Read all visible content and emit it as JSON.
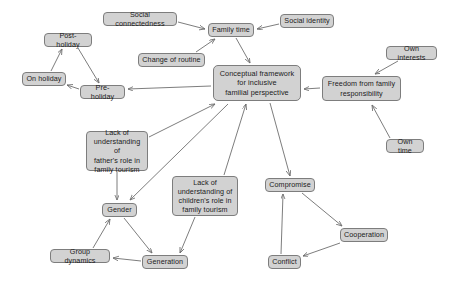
{
  "diagram": {
    "type": "concept-map",
    "canvas": {
      "width": 460,
      "height": 288
    },
    "style": {
      "node_fill": "#d2d2d2",
      "node_border": "#7d7d7d",
      "node_text": "#1b1b1b",
      "arrow_color": "#6e6e6e",
      "background": "#ffffff"
    },
    "nodes": [
      {
        "id": "social_connectedness",
        "label": "Social connectedness",
        "x": 103,
        "y": 12,
        "w": 74,
        "h": 14
      },
      {
        "id": "family_time",
        "label": "Family time",
        "x": 208,
        "y": 23,
        "w": 46,
        "h": 14
      },
      {
        "id": "social_identity",
        "label": "Social identity",
        "x": 280,
        "y": 14,
        "w": 54,
        "h": 14
      },
      {
        "id": "post_holiday",
        "label": "Post-holiday",
        "x": 44,
        "y": 33,
        "w": 48,
        "h": 14
      },
      {
        "id": "own_interests",
        "label": "Own interests",
        "x": 386,
        "y": 46,
        "w": 51,
        "h": 14
      },
      {
        "id": "change_of_routine",
        "label": "Change of routine",
        "x": 138,
        "y": 53,
        "w": 67,
        "h": 14
      },
      {
        "id": "on_holiday",
        "label": "On holiday",
        "x": 22,
        "y": 72,
        "w": 44,
        "h": 14
      },
      {
        "id": "conceptual_framework",
        "label": "Conceptual framework\nfor inclusive\nfamilial perspective",
        "x": 213,
        "y": 65,
        "w": 88,
        "h": 36
      },
      {
        "id": "freedom_family_resp",
        "label": "Freedom from family\nresponsibility",
        "x": 322,
        "y": 76,
        "w": 79,
        "h": 25
      },
      {
        "id": "pre_holiday",
        "label": "Pre-holiday",
        "x": 80,
        "y": 85,
        "w": 45,
        "h": 14
      },
      {
        "id": "own_time",
        "label": "Own time",
        "x": 386,
        "y": 139,
        "w": 38,
        "h": 14
      },
      {
        "id": "lack_fathers_role",
        "label": "Lack of\nunderstanding of\nfather's role in\nfamily tourism",
        "x": 86,
        "y": 131,
        "w": 62,
        "h": 40
      },
      {
        "id": "lack_childrens_role",
        "label": "Lack of\nunderstanding of\nchildren's role in\nfamily tourism",
        "x": 172,
        "y": 176,
        "w": 66,
        "h": 40
      },
      {
        "id": "compromise",
        "label": "Compromise",
        "x": 265,
        "y": 178,
        "w": 50,
        "h": 14
      },
      {
        "id": "gender",
        "label": "Gender",
        "x": 102,
        "y": 203,
        "w": 35,
        "h": 14
      },
      {
        "id": "cooperation",
        "label": "Cooperation",
        "x": 340,
        "y": 228,
        "w": 48,
        "h": 14
      },
      {
        "id": "group_dynamics",
        "label": "Group dynamics",
        "x": 50,
        "y": 249,
        "w": 60,
        "h": 14
      },
      {
        "id": "generation",
        "label": "Generation",
        "x": 142,
        "y": 255,
        "w": 46,
        "h": 14
      },
      {
        "id": "conflict",
        "label": "Conflict",
        "x": 268,
        "y": 255,
        "w": 33,
        "h": 14
      }
    ],
    "edges": [
      {
        "from": "social_connectedness",
        "to": "family_time",
        "x1": 178,
        "y1": 22,
        "x2": 205,
        "y2": 29
      },
      {
        "from": "social_identity",
        "to": "family_time",
        "x1": 279,
        "y1": 24,
        "x2": 257,
        "y2": 29
      },
      {
        "from": "family_time",
        "to": "conceptual_framework",
        "x1": 236,
        "y1": 38,
        "x2": 250,
        "y2": 63
      },
      {
        "from": "change_of_routine",
        "to": "family_time",
        "x1": 196,
        "y1": 52,
        "x2": 215,
        "y2": 39
      },
      {
        "from": "post_holiday",
        "to": "pre_holiday",
        "x1": 78,
        "y1": 48,
        "x2": 99,
        "y2": 83
      },
      {
        "from": "pre_holiday",
        "to": "on_holiday",
        "x1": 79,
        "y1": 89,
        "x2": 67,
        "y2": 85
      },
      {
        "from": "on_holiday",
        "to": "post_holiday",
        "x1": 51,
        "y1": 71,
        "x2": 62,
        "y2": 49
      },
      {
        "from": "conceptual_framework",
        "to": "pre_holiday",
        "x1": 211,
        "y1": 86,
        "x2": 128,
        "y2": 89
      },
      {
        "from": "own_interests",
        "to": "freedom_family_resp",
        "x1": 398,
        "y1": 61,
        "x2": 375,
        "y2": 74
      },
      {
        "from": "freedom_family_resp",
        "to": "conceptual_framework",
        "x1": 320,
        "y1": 88,
        "x2": 304,
        "y2": 89
      },
      {
        "from": "own_time",
        "to": "freedom_family_resp",
        "x1": 390,
        "y1": 138,
        "x2": 372,
        "y2": 105
      },
      {
        "from": "lack_fathers_role",
        "to": "conceptual_framework",
        "x1": 149,
        "y1": 137,
        "x2": 215,
        "y2": 104
      },
      {
        "from": "conceptual_framework",
        "to": "gender",
        "x1": 228,
        "y1": 104,
        "x2": 130,
        "y2": 200
      },
      {
        "from": "lack_childrens_role",
        "to": "conceptual_framework",
        "x1": 224,
        "y1": 175,
        "x2": 246,
        "y2": 104
      },
      {
        "from": "conceptual_framework",
        "to": "compromise",
        "x1": 270,
        "y1": 103,
        "x2": 290,
        "y2": 176
      },
      {
        "from": "lack_fathers_role",
        "to": "gender",
        "x1": 117,
        "y1": 172,
        "x2": 117,
        "y2": 200
      },
      {
        "from": "gender",
        "to": "generation",
        "x1": 124,
        "y1": 218,
        "x2": 152,
        "y2": 253
      },
      {
        "from": "lack_childrens_role",
        "to": "generation",
        "x1": 195,
        "y1": 217,
        "x2": 180,
        "y2": 253
      },
      {
        "from": "generation",
        "to": "group_dynamics",
        "x1": 141,
        "y1": 261,
        "x2": 113,
        "y2": 258
      },
      {
        "from": "group_dynamics",
        "to": "gender",
        "x1": 93,
        "y1": 248,
        "x2": 110,
        "y2": 219
      },
      {
        "from": "compromise",
        "to": "cooperation",
        "x1": 302,
        "y1": 193,
        "x2": 342,
        "y2": 226
      },
      {
        "from": "cooperation",
        "to": "conflict",
        "x1": 340,
        "y1": 243,
        "x2": 303,
        "y2": 256
      },
      {
        "from": "conflict",
        "to": "compromise",
        "x1": 281,
        "y1": 254,
        "x2": 283,
        "y2": 194
      }
    ]
  }
}
